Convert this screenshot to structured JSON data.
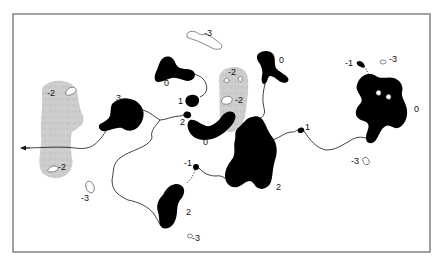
{
  "figure": {
    "type": "region-connectivity-diagram",
    "frame": {
      "x": 13,
      "y": 14,
      "width": 417,
      "height": 238
    },
    "colors": {
      "solid_region": "#000000",
      "patterned_region": "#cfcfcf",
      "outline_region": "#ffffff",
      "frame": "#8a8a8a"
    },
    "labels": [
      {
        "id": "l-minus3-top",
        "text": "-3",
        "x": 204,
        "y": 36
      },
      {
        "id": "l-0-upper-center",
        "text": "0",
        "x": 164,
        "y": 86
      },
      {
        "id": "l-minus2-left-top",
        "text": "-2",
        "x": 47,
        "y": 96
      },
      {
        "id": "l-3",
        "text": "3",
        "x": 116,
        "y": 101
      },
      {
        "id": "l-1-center",
        "text": "1",
        "x": 178,
        "y": 104
      },
      {
        "id": "l-2-center",
        "text": "2",
        "x": 180,
        "y": 125
      },
      {
        "id": "l-0-center-bottom",
        "text": "0",
        "x": 203,
        "y": 145
      },
      {
        "id": "l-minus2-grey-top",
        "text": "-2",
        "x": 228,
        "y": 75
      },
      {
        "id": "l-minus2-grey-mid",
        "text": "-2",
        "x": 235,
        "y": 103
      },
      {
        "id": "l-0-top-right-center",
        "text": "0",
        "x": 279,
        "y": 63
      },
      {
        "id": "l-minus1-right",
        "text": "-1",
        "x": 345,
        "y": 66
      },
      {
        "id": "l-minus3-right-top",
        "text": "-3",
        "x": 389,
        "y": 62
      },
      {
        "id": "l-0-right",
        "text": "0",
        "x": 414,
        "y": 112
      },
      {
        "id": "l-1-right",
        "text": "1",
        "x": 305,
        "y": 130
      },
      {
        "id": "l-minus3-right-bottom",
        "text": "-3",
        "x": 351,
        "y": 164
      },
      {
        "id": "l-2-right-center",
        "text": "2",
        "x": 276,
        "y": 190
      },
      {
        "id": "l-minus2-left-bottom",
        "text": "-2",
        "x": 58,
        "y": 170
      },
      {
        "id": "l-minus3-left-bottom",
        "text": "-3",
        "x": 81,
        "y": 201
      },
      {
        "id": "l-minus1-center-bottom",
        "text": "-1",
        "x": 184,
        "y": 166
      },
      {
        "id": "l-2-center-bottom",
        "text": "2",
        "x": 186,
        "y": 215
      },
      {
        "id": "l-minus3-bottom",
        "text": "-3",
        "x": 192,
        "y": 241
      }
    ]
  }
}
